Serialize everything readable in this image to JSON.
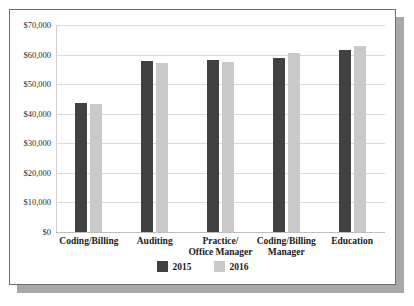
{
  "chart_data": {
    "type": "bar",
    "title": "",
    "subtitle": "",
    "xlabel": "",
    "ylabel": "",
    "ylim": [
      0,
      70000
    ],
    "ytick_labels": [
      "$70,000",
      "$60,000",
      "$50,000",
      "$40,000",
      "$30,000",
      "$20,000",
      "$10,000",
      "$0"
    ],
    "ytick_values": [
      70000,
      60000,
      50000,
      40000,
      30000,
      20000,
      10000,
      0
    ],
    "grid": true,
    "legend_position": "bottom-center",
    "categories": [
      "Coding/Billing",
      "Auditing",
      "Practice/\nOffice Manager",
      "Coding/Billing\nManager",
      "Education"
    ],
    "series": [
      {
        "name": "2015",
        "color": "#414141",
        "values": [
          43500,
          57800,
          58300,
          58800,
          61500
        ]
      },
      {
        "name": "2016",
        "color": "#c9c9c9",
        "values": [
          43400,
          57200,
          57500,
          60700,
          63000
        ]
      }
    ]
  },
  "legend": {
    "items": [
      {
        "label": "2015",
        "color": "#414141"
      },
      {
        "label": "2016",
        "color": "#c9c9c9"
      }
    ]
  },
  "categories_display": [
    {
      "line1": "Coding/Billing",
      "line2": ""
    },
    {
      "line1": "Auditing",
      "line2": ""
    },
    {
      "line1": "Practice/",
      "line2": "Office Manager"
    },
    {
      "line1": "Coding/Billing",
      "line2": "Manager"
    },
    {
      "line1": "Education",
      "line2": ""
    }
  ],
  "yticks": [
    {
      "label": "$70,000",
      "value": 70000
    },
    {
      "label": "$60,000",
      "value": 60000
    },
    {
      "label": "$50,000",
      "value": 50000
    },
    {
      "label": "$40,000",
      "value": 40000
    },
    {
      "label": "$30,000",
      "value": 30000
    },
    {
      "label": "$20,000",
      "value": 20000
    },
    {
      "label": "$10,000",
      "value": 10000
    },
    {
      "label": "$0",
      "value": 0
    }
  ],
  "colors": {
    "series_2015": "#414141",
    "series_2016": "#c9c9c9",
    "gridline": "#d9d9d9",
    "frame_border": "#6e6e6e",
    "shadow": "#a8a8a8",
    "background": "#ffffff"
  }
}
